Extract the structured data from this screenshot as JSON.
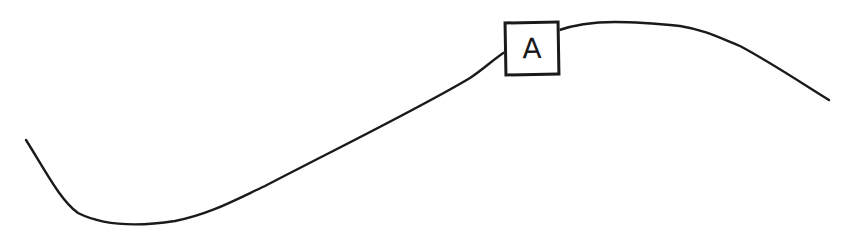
{
  "diagram": {
    "type": "hand-drawn-curve",
    "stroke_color": "#1a1a1a",
    "background": "#ffffff",
    "curve": {
      "description": "S-shaped curve: descends from upper-left to a trough, rises through a labeled point, peaks, then descends to the right",
      "start": [
        26,
        140
      ],
      "trough": [
        125,
        226
      ],
      "peak": [
        615,
        22
      ],
      "end": [
        829,
        100
      ]
    },
    "marker": {
      "label": "A",
      "position": [
        530,
        46
      ],
      "shape": "square-box"
    }
  }
}
